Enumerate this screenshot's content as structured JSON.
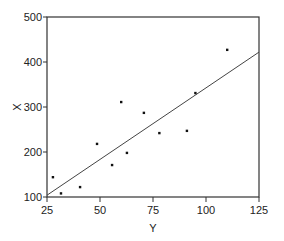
{
  "chart_data": {
    "type": "scatter",
    "title": "",
    "xlabel": "Y",
    "ylabel": "X",
    "xlim": [
      25,
      125
    ],
    "ylim": [
      100,
      500
    ],
    "xticks": [
      25,
      50,
      75,
      100,
      125
    ],
    "yticks": [
      100,
      200,
      300,
      400,
      500
    ],
    "grid": false,
    "legend": null,
    "points": [
      {
        "x": 27.8,
        "y": 144
      },
      {
        "x": 31.6,
        "y": 108
      },
      {
        "x": 40.6,
        "y": 122
      },
      {
        "x": 48.6,
        "y": 218
      },
      {
        "x": 55.7,
        "y": 171
      },
      {
        "x": 60.0,
        "y": 311
      },
      {
        "x": 62.7,
        "y": 198
      },
      {
        "x": 70.7,
        "y": 287
      },
      {
        "x": 78.0,
        "y": 242
      },
      {
        "x": 91.0,
        "y": 247
      },
      {
        "x": 95.0,
        "y": 331
      },
      {
        "x": 110.0,
        "y": 427
      }
    ],
    "fit_line": {
      "x": [
        25,
        125
      ],
      "y": [
        104,
        422
      ]
    }
  },
  "colors": {
    "axis": "#333333",
    "points": "#111111",
    "line": "#444444"
  }
}
